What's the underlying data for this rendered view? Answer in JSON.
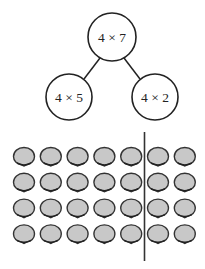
{
  "tree": {
    "root": {
      "label": "4 × 7",
      "cx": 112,
      "cy": 37,
      "r": 24
    },
    "children": [
      {
        "label": "4 × 5",
        "cx": 69,
        "cy": 97,
        "r": 23
      },
      {
        "label": "4 × 2",
        "cx": 155,
        "cy": 97,
        "r": 23
      }
    ]
  },
  "array": {
    "rows": 4,
    "cols": 7,
    "left_group_cols": 5,
    "right_group_cols": 2,
    "item_icon": "shell-icon",
    "item_fill": "#c8c8c8",
    "item_stroke": "#333333"
  },
  "divider": {
    "x": 144.5,
    "y1": 132,
    "y2": 261
  }
}
